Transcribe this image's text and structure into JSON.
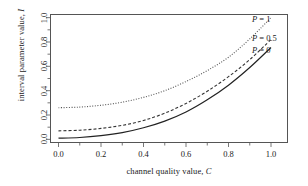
{
  "chart_data": {
    "type": "line",
    "title": "",
    "xlabel": "channel quality value, C",
    "ylabel": "interval parameter value, I",
    "xlim": [
      -0.04,
      1.08
    ],
    "ylim": [
      -0.03,
      1.03
    ],
    "grid": false,
    "legend_position": "top-right-inline",
    "xticks": [
      "0.0",
      "0.2",
      "0.4",
      "0.6",
      "0.8",
      "1.0"
    ],
    "xtick_values": [
      0.0,
      0.2,
      0.4,
      0.6,
      0.8,
      1.0
    ],
    "xminor_ticks": [
      0.1,
      0.3,
      0.5,
      0.7,
      0.9
    ],
    "yticks": [
      "0.0",
      "0.2",
      "0.4",
      "0.6",
      "0.8",
      "1.0"
    ],
    "ytick_values": [
      0.0,
      0.2,
      0.4,
      0.6,
      0.8,
      1.0
    ],
    "yminor_ticks": [
      0.1,
      0.3,
      0.5,
      0.7,
      0.9
    ],
    "x": [
      0.0,
      0.1,
      0.2,
      0.3,
      0.4,
      0.5,
      0.6,
      0.7,
      0.8,
      0.9,
      1.0
    ],
    "series": [
      {
        "name": "P = 1",
        "label": "P = 1",
        "style": "dotted",
        "color": "#555555",
        "values": [
          0.26,
          0.265,
          0.28,
          0.305,
          0.345,
          0.4,
          0.475,
          0.565,
          0.675,
          0.825,
          1.0
        ]
      },
      {
        "name": "P = 0.5",
        "label": "P = 0.5",
        "style": "dashed",
        "color": "#333333",
        "values": [
          0.07,
          0.075,
          0.09,
          0.115,
          0.155,
          0.215,
          0.295,
          0.395,
          0.515,
          0.655,
          0.82
        ]
      },
      {
        "name": "P = 0",
        "label": "P = 0",
        "style": "solid",
        "color": "#222222",
        "values": [
          0.01,
          0.015,
          0.03,
          0.055,
          0.095,
          0.15,
          0.225,
          0.325,
          0.445,
          0.59,
          0.755
        ]
      }
    ]
  },
  "legend": {
    "p1": {
      "var": "P",
      "eq": " = 1"
    },
    "p05": {
      "var": "P",
      "eq": " = 0.5"
    },
    "p0": {
      "var": "P",
      "eq": " = 0"
    }
  },
  "axes": {
    "x_title_text": "channel quality value, ",
    "x_title_var": "C",
    "y_title_text": "interval parameter value, ",
    "y_title_var": "I"
  }
}
